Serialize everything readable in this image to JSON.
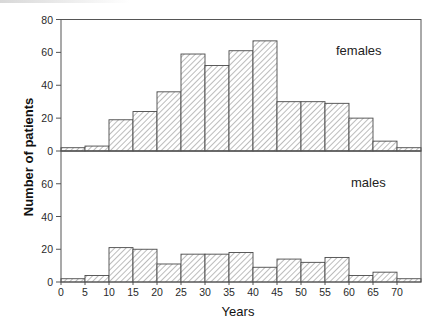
{
  "chart_data": {
    "type": "bar",
    "subtype": "histogram",
    "title": "",
    "xlabel": "Years",
    "ylabel": "Number of patients",
    "x_bins": [
      [
        0,
        5
      ],
      [
        5,
        10
      ],
      [
        10,
        15
      ],
      [
        15,
        20
      ],
      [
        20,
        25
      ],
      [
        25,
        30
      ],
      [
        30,
        35
      ],
      [
        35,
        40
      ],
      [
        40,
        45
      ],
      [
        45,
        50
      ],
      [
        50,
        55
      ],
      [
        55,
        60
      ],
      [
        60,
        65
      ],
      [
        65,
        70
      ],
      [
        70,
        75
      ]
    ],
    "x_ticks": [
      0,
      5,
      10,
      15,
      20,
      25,
      30,
      35,
      40,
      45,
      50,
      55,
      60,
      65,
      70
    ],
    "xlim": [
      0,
      75
    ],
    "grid": false,
    "panels": [
      {
        "name": "females",
        "label": "females",
        "ylim": [
          0,
          80
        ],
        "y_ticks": [
          0,
          20,
          40,
          60,
          80
        ],
        "values": [
          2,
          3,
          19,
          24,
          36,
          59,
          52,
          61,
          67,
          30,
          30,
          29,
          20,
          6,
          2
        ]
      },
      {
        "name": "males",
        "label": "males",
        "ylim": [
          0,
          80
        ],
        "y_ticks": [
          0,
          20,
          40,
          60
        ],
        "values": [
          2,
          4,
          21,
          20,
          11,
          17,
          17,
          18,
          9,
          14,
          12,
          15,
          4,
          6,
          2
        ]
      }
    ],
    "series": [
      {
        "name": "females",
        "values": [
          2,
          3,
          19,
          24,
          36,
          59,
          52,
          61,
          67,
          30,
          30,
          29,
          20,
          6,
          2
        ]
      },
      {
        "name": "males",
        "values": [
          2,
          4,
          21,
          20,
          11,
          17,
          17,
          18,
          9,
          14,
          12,
          15,
          4,
          6,
          2
        ]
      }
    ],
    "categories": [
      "0-5",
      "5-10",
      "10-15",
      "15-20",
      "20-25",
      "25-30",
      "30-35",
      "35-40",
      "40-45",
      "45-50",
      "50-55",
      "55-60",
      "60-65",
      "65-70",
      "70-75"
    ],
    "legend": "in-panel text labels (top-right)",
    "style": {
      "bar_fill": "diagonal hatch",
      "bar_stroke": "#4a4a4a",
      "frame": "#555555"
    }
  },
  "labels": {
    "xlabel": "Years",
    "ylabel": "Number of patients",
    "females": "females",
    "males": "males"
  }
}
